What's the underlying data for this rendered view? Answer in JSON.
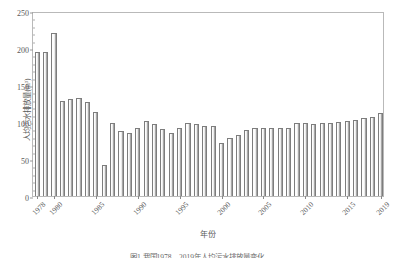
{
  "chart_data": {
    "type": "bar",
    "title": "",
    "xlabel": "年份",
    "ylabel": "人均污水排放量(m³)",
    "ylim": [
      0,
      250
    ],
    "yticks": [
      0,
      50,
      100,
      150,
      200,
      250
    ],
    "ytick_labels": [
      "0",
      "50",
      "100",
      "150",
      "200",
      "250"
    ],
    "grid": false,
    "legend": null,
    "xtick_labels": [
      "1978",
      "1980",
      "1985",
      "1990",
      "1995",
      "2000",
      "2005",
      "2010",
      "2015",
      "2019"
    ],
    "categories": [
      "1978",
      "1979",
      "1980",
      "1981",
      "1982",
      "1983",
      "1984",
      "1985",
      "1986",
      "1987",
      "1988",
      "1989",
      "1990",
      "1991",
      "1992",
      "1993",
      "1994",
      "1995",
      "1996",
      "1997",
      "1998",
      "1999",
      "2000",
      "2001",
      "2002",
      "2003",
      "2004",
      "2005",
      "2006",
      "2007",
      "2008",
      "2009",
      "2010",
      "2011",
      "2012",
      "2013",
      "2014",
      "2015",
      "2016",
      "2017",
      "2018",
      "2019"
    ],
    "values": [
      195,
      194,
      220,
      128,
      131,
      132,
      127,
      113,
      42,
      99,
      88,
      85,
      92,
      101,
      97,
      90,
      85,
      92,
      99,
      97,
      95,
      95,
      71,
      78,
      82,
      89,
      92,
      92,
      92,
      92,
      92,
      98,
      98,
      97,
      99,
      99,
      100,
      101,
      103,
      105,
      107,
      112
    ]
  },
  "caption": {
    "text": "图1  我国1978—2019年人均污水排放量变化"
  }
}
